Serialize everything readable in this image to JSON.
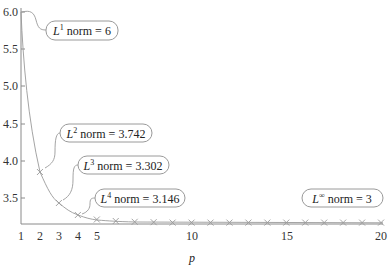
{
  "chart_data": {
    "type": "line",
    "title": "",
    "xlabel": "p",
    "ylabel": "",
    "x_ticks": [
      1,
      2,
      3,
      4,
      5,
      10,
      15,
      20
    ],
    "y_ticks": [
      "3.5",
      "4.0",
      "4.5",
      "5.0",
      "5.5",
      "6.0"
    ],
    "xlim": [
      1,
      20
    ],
    "ylim": [
      3.15,
      6.0
    ],
    "grid": false,
    "series": [
      {
        "name": "Lp norm",
        "x": [
          1,
          2,
          3,
          4,
          5,
          6,
          7,
          8,
          9,
          10,
          11,
          12,
          13,
          14,
          15,
          16,
          17,
          18,
          19,
          20
        ],
        "values": [
          6,
          3.742,
          3.302,
          3.146,
          3.077,
          3.04,
          3.021,
          3.011,
          3.006,
          3.003,
          3.002,
          3.001,
          3.001,
          3.0,
          3.0,
          3.0,
          3.0,
          3.0,
          3.0,
          3.0
        ],
        "color": "#a0a0a0",
        "marker": "x"
      }
    ],
    "annotations": [
      {
        "base": "L",
        "sup": "1",
        "text": " norm = 6",
        "p": 1
      },
      {
        "base": "L",
        "sup": "2",
        "text": " norm = 3.742",
        "p": 2
      },
      {
        "base": "L",
        "sup": "3",
        "text": " norm = 3.302",
        "p": 3
      },
      {
        "base": "L",
        "sup": "4",
        "text": " norm = 3.146",
        "p": 4
      },
      {
        "base": "L",
        "sup": "∞",
        "text": " norm = 3",
        "p": null
      }
    ]
  }
}
